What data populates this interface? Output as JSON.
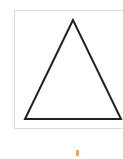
{
  "shape": {
    "type": "triangle-icon",
    "stroke_color": "#222222",
    "fill_color": "#ffffff",
    "frame_color": "#dcdcdc"
  },
  "marker": {
    "color": "#f0a868"
  }
}
